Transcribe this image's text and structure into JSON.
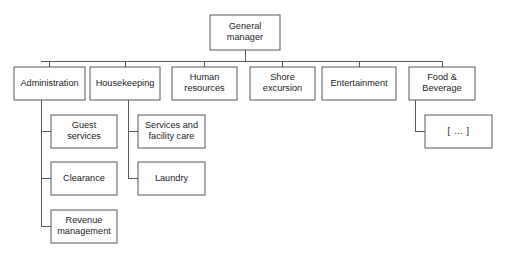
{
  "diagram": {
    "type": "org-chart",
    "canvas": {
      "width": 505,
      "height": 257,
      "background": "#ffffff"
    },
    "style": {
      "box_fill": "#ffffff",
      "box_stroke": "#555a5e",
      "line_stroke": "#555a5e",
      "text_color": "#1d1d1d"
    },
    "nodes": [
      {
        "id": "general-manager",
        "label": "General manager",
        "lines": [
          "General",
          "manager"
        ],
        "level": 0,
        "x": 210,
        "y": 15,
        "w": 70,
        "h": 35
      },
      {
        "id": "administration",
        "label": "Administration",
        "lines": [
          "Administration"
        ],
        "level": 1,
        "x": 14,
        "y": 67,
        "w": 71,
        "h": 33
      },
      {
        "id": "housekeeping",
        "label": "Housekeeping",
        "lines": [
          "Housekeeping"
        ],
        "level": 1,
        "x": 90,
        "y": 67,
        "w": 70,
        "h": 33
      },
      {
        "id": "human-resources",
        "label": "Human resources",
        "lines": [
          "Human",
          "resources"
        ],
        "level": 1,
        "x": 172,
        "y": 67,
        "w": 65,
        "h": 33
      },
      {
        "id": "shore-excursion",
        "label": "Shore excursion",
        "lines": [
          "Shore",
          "excursion"
        ],
        "level": 1,
        "x": 250,
        "y": 67,
        "w": 65,
        "h": 33
      },
      {
        "id": "entertainment",
        "label": "Entertainment",
        "lines": [
          "Entertainment"
        ],
        "level": 1,
        "x": 322,
        "y": 67,
        "w": 74,
        "h": 33
      },
      {
        "id": "food-and-beverage",
        "label": "Food & Beverage",
        "lines": [
          "Food &",
          "Beverage"
        ],
        "level": 1,
        "x": 409,
        "y": 67,
        "w": 66,
        "h": 33
      },
      {
        "id": "guest-services",
        "label": "Guest services",
        "lines": [
          "Guest",
          "services"
        ],
        "level": 2,
        "parent": "administration",
        "x": 51,
        "y": 115,
        "w": 66,
        "h": 33
      },
      {
        "id": "clearance",
        "label": "Clearance",
        "lines": [
          "Clearance"
        ],
        "level": 2,
        "parent": "administration",
        "x": 51,
        "y": 162,
        "w": 66,
        "h": 33
      },
      {
        "id": "revenue-management",
        "label": "Revenue management",
        "lines": [
          "Revenue",
          "management"
        ],
        "level": 2,
        "parent": "administration",
        "x": 51,
        "y": 210,
        "w": 66,
        "h": 33
      },
      {
        "id": "services-and-facility-care",
        "label": "Services and facility care",
        "lines": [
          "Services and",
          "facility care"
        ],
        "level": 2,
        "parent": "housekeeping",
        "x": 138,
        "y": 115,
        "w": 67,
        "h": 33
      },
      {
        "id": "laundry",
        "label": "Laundry",
        "lines": [
          "Laundry"
        ],
        "level": 2,
        "parent": "housekeeping",
        "x": 138,
        "y": 162,
        "w": 67,
        "h": 33
      },
      {
        "id": "food-beverage-more",
        "label": "[ … ]",
        "lines": [
          "[ … ]"
        ],
        "level": 2,
        "parent": "food-and-beverage",
        "x": 425,
        "y": 115,
        "w": 67,
        "h": 33,
        "placeholder": true
      }
    ],
    "connectors": {
      "root_stub": {
        "x": 245,
        "y1": 50,
        "y2": 61
      },
      "bus": {
        "y": 61,
        "x1": 41,
        "x2": 442
      },
      "level1_stubs_y": {
        "y1": 61,
        "y2": 67
      },
      "branches": [
        {
          "parent": "administration",
          "trunk_x": 41,
          "trunk_y1": 100,
          "trunk_y2": 226.5
        },
        {
          "parent": "housekeeping",
          "trunk_x": 128,
          "trunk_y1": 100,
          "trunk_y2": 178.5
        },
        {
          "parent": "food-and-beverage",
          "trunk_x": 415,
          "trunk_y1": 100,
          "trunk_y2": 131.5
        }
      ]
    }
  }
}
